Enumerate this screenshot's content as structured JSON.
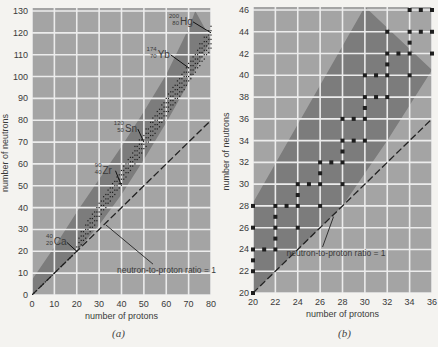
{
  "colors": {
    "page_bg": "#f4f3f0",
    "plot_bg": "#a4a4a4",
    "band": "#7c7c7c",
    "grid": "#ececec",
    "dot": "#1e1e1e",
    "text": "#3a3a3a"
  },
  "chart_data": [
    {
      "id": "a",
      "type": "scatter",
      "caption": "(a)",
      "title": "",
      "xlabel": "number of protons",
      "ylabel": "number of neutrons",
      "xlim": [
        0,
        80
      ],
      "ylim": [
        0,
        130
      ],
      "xticks": [
        0,
        10,
        20,
        30,
        40,
        50,
        60,
        70,
        80
      ],
      "yticks": [
        0,
        10,
        20,
        30,
        40,
        50,
        60,
        70,
        80,
        90,
        100,
        110,
        120,
        130
      ],
      "grid": true,
      "legend": null,
      "stability_band": {
        "upper": [
          [
            0,
            7
          ],
          [
            10,
            22
          ],
          [
            20,
            38
          ],
          [
            30,
            53
          ],
          [
            40,
            68
          ],
          [
            50,
            84
          ],
          [
            60,
            101
          ],
          [
            70,
            122
          ],
          [
            73,
            130
          ]
        ],
        "lower": [
          [
            0,
            0
          ],
          [
            10,
            10
          ],
          [
            20,
            20
          ],
          [
            30,
            32
          ],
          [
            40,
            46
          ],
          [
            50,
            62
          ],
          [
            60,
            79
          ],
          [
            70,
            97
          ],
          [
            80,
            117
          ]
        ]
      },
      "reference_line": {
        "label": "neutron-to-proton ratio = 1",
        "from": [
          0,
          0
        ],
        "to": [
          80,
          80
        ],
        "style": "dashed"
      },
      "annotations": [
        {
          "mass": "40",
          "atomic": "20",
          "symbol": "Ca",
          "point": [
            20,
            20
          ]
        },
        {
          "mass": "90",
          "atomic": "40",
          "symbol": "Zr",
          "point": [
            40,
            50
          ]
        },
        {
          "mass": "120",
          "atomic": "50",
          "symbol": "Sn",
          "point": [
            50,
            70
          ]
        },
        {
          "mass": "174",
          "atomic": "70",
          "symbol": "Yb",
          "point": [
            70,
            104
          ]
        },
        {
          "mass": "200",
          "atomic": "80",
          "symbol": "Hg",
          "point": [
            80,
            120
          ]
        }
      ],
      "label_callout": {
        "text": "neutron-to-proton ratio = 1",
        "anchor": [
          33,
          33
        ],
        "text_pos": [
          38,
          10
        ]
      }
    },
    {
      "id": "b",
      "type": "scatter",
      "caption": "(b)",
      "title": "",
      "xlabel": "number of protons",
      "ylabel": "number of neutrons",
      "xlim": [
        20,
        36
      ],
      "ylim": [
        20,
        46
      ],
      "xticks": [
        20,
        22,
        24,
        26,
        28,
        30,
        32,
        34,
        36
      ],
      "yticks": [
        20,
        22,
        24,
        26,
        28,
        30,
        32,
        34,
        36,
        38,
        40,
        42,
        44,
        46
      ],
      "grid": true,
      "legend": null,
      "stability_band": {
        "upper": [
          [
            20,
            28.3
          ],
          [
            24,
            35.5
          ],
          [
            28,
            42.7
          ],
          [
            30,
            46.3
          ]
        ],
        "lower": [
          [
            20,
            20
          ],
          [
            24,
            24
          ],
          [
            28,
            28
          ],
          [
            32,
            34
          ],
          [
            36,
            40.5
          ]
        ]
      },
      "reference_line": {
        "label": "neutron-to-proton ratio = 1",
        "from": [
          20,
          20
        ],
        "to": [
          36,
          36
        ],
        "style": "dashed"
      },
      "label_callout": {
        "text": "neutron-to-proton ratio = 1",
        "anchor": [
          27.2,
          27.2
        ],
        "text_pos": [
          23,
          23.4
        ]
      },
      "points": [
        [
          20,
          20
        ],
        [
          20,
          22
        ],
        [
          20,
          23
        ],
        [
          20,
          24
        ],
        [
          20,
          26
        ],
        [
          20,
          28
        ],
        [
          21,
          24
        ],
        [
          22,
          24
        ],
        [
          22,
          25
        ],
        [
          22,
          26
        ],
        [
          22,
          27
        ],
        [
          22,
          28
        ],
        [
          23,
          28
        ],
        [
          24,
          26
        ],
        [
          24,
          28
        ],
        [
          24,
          29
        ],
        [
          24,
          30
        ],
        [
          25,
          30
        ],
        [
          26,
          28
        ],
        [
          26,
          30
        ],
        [
          26,
          31
        ],
        [
          26,
          32
        ],
        [
          27,
          32
        ],
        [
          28,
          30
        ],
        [
          28,
          32
        ],
        [
          28,
          33
        ],
        [
          28,
          34
        ],
        [
          28,
          36
        ],
        [
          29,
          34
        ],
        [
          29,
          36
        ],
        [
          30,
          34
        ],
        [
          30,
          36
        ],
        [
          30,
          37
        ],
        [
          30,
          38
        ],
        [
          30,
          40
        ],
        [
          31,
          38
        ],
        [
          31,
          40
        ],
        [
          32,
          38
        ],
        [
          32,
          40
        ],
        [
          32,
          41
        ],
        [
          32,
          42
        ],
        [
          32,
          44
        ],
        [
          33,
          42
        ],
        [
          34,
          40
        ],
        [
          34,
          42
        ],
        [
          34,
          43
        ],
        [
          34,
          44
        ],
        [
          34,
          46
        ],
        [
          35,
          44
        ],
        [
          35,
          46
        ],
        [
          36,
          42
        ],
        [
          36,
          44
        ],
        [
          36,
          46
        ]
      ]
    }
  ],
  "geometry": [
    {
      "left": 32,
      "right": 211,
      "top": 11,
      "bottom": 295
    },
    {
      "left": 253,
      "right": 432,
      "top": 10,
      "bottom": 293
    }
  ]
}
